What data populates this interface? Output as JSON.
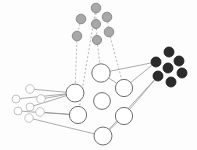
{
  "figure": {
    "background_color": "#fdfdfd",
    "width": 197,
    "height": 150
  },
  "palette": {
    "hub_fill": "#ffffff",
    "hub_stroke": "#6e6e6e",
    "leaf_light_fill": "#ffffff",
    "leaf_light_stroke": "#b4b4b4",
    "leaf_gray_fill": "#a8a8a8",
    "leaf_gray_stroke": "#7c7c7c",
    "leaf_dark_fill": "#2b2b2b",
    "leaf_dark_stroke": "#1a1a1a",
    "edge_solid": "#8a8a8a",
    "edge_dashed": "#9a9a9a"
  },
  "groups": [
    {
      "id": "hub",
      "label": "hub-nodes",
      "style": "hollow-large",
      "radius": 8.5,
      "count": 7
    },
    {
      "id": "light",
      "label": "light-leaf-cluster",
      "style": "hollow-small",
      "radius": 4.2,
      "count": 7
    },
    {
      "id": "gray",
      "label": "gray-leaf-cluster",
      "style": "filled-gray",
      "radius": 4.6,
      "count": 7
    },
    {
      "id": "dark",
      "label": "dark-leaf-cluster",
      "style": "filled-dark",
      "radius": 5.0,
      "count": 7
    }
  ],
  "nodes": [
    {
      "id": "H1",
      "group": "hub",
      "cx": 75,
      "cy": 93,
      "r": 9.0
    },
    {
      "id": "H2",
      "group": "hub",
      "cx": 78,
      "cy": 115,
      "r": 8.6
    },
    {
      "id": "H3",
      "group": "hub",
      "cx": 101,
      "cy": 73,
      "r": 9.2
    },
    {
      "id": "H4",
      "group": "hub",
      "cx": 102,
      "cy": 101,
      "r": 8.4
    },
    {
      "id": "H5",
      "group": "hub",
      "cx": 103,
      "cy": 136,
      "r": 9.0
    },
    {
      "id": "H6",
      "group": "hub",
      "cx": 124,
      "cy": 88,
      "r": 8.6
    },
    {
      "id": "H7",
      "group": "hub",
      "cx": 124,
      "cy": 116,
      "r": 8.6
    },
    {
      "id": "L1",
      "group": "light",
      "cx": 30,
      "cy": 89,
      "r": 4.3
    },
    {
      "id": "L2",
      "group": "light",
      "cx": 16,
      "cy": 99,
      "r": 4.0
    },
    {
      "id": "L3",
      "group": "light",
      "cx": 41,
      "cy": 99,
      "r": 4.3
    },
    {
      "id": "L4",
      "group": "light",
      "cx": 18,
      "cy": 111,
      "r": 4.0
    },
    {
      "id": "L5",
      "group": "light",
      "cx": 40,
      "cy": 112,
      "r": 4.3
    },
    {
      "id": "L6",
      "group": "light",
      "cx": 29,
      "cy": 118,
      "r": 4.2
    },
    {
      "id": "L7",
      "group": "light",
      "cx": 30,
      "cy": 107,
      "r": 4.0
    },
    {
      "id": "G1",
      "group": "gray",
      "cx": 96,
      "cy": 8,
      "r": 4.8
    },
    {
      "id": "G2",
      "group": "gray",
      "cx": 81,
      "cy": 19,
      "r": 4.8
    },
    {
      "id": "G3",
      "group": "gray",
      "cx": 107,
      "cy": 17,
      "r": 4.8
    },
    {
      "id": "G4",
      "group": "gray",
      "cx": 96,
      "cy": 24,
      "r": 4.6
    },
    {
      "id": "G5",
      "group": "gray",
      "cx": 109,
      "cy": 32,
      "r": 4.8
    },
    {
      "id": "G6",
      "group": "gray",
      "cx": 77,
      "cy": 36,
      "r": 4.8
    },
    {
      "id": "G7",
      "group": "gray",
      "cx": 97,
      "cy": 40,
      "r": 4.6
    },
    {
      "id": "D1",
      "group": "dark",
      "cx": 169,
      "cy": 52,
      "r": 5.0
    },
    {
      "id": "D2",
      "group": "dark",
      "cx": 156,
      "cy": 62,
      "r": 5.0
    },
    {
      "id": "D3",
      "group": "dark",
      "cx": 179,
      "cy": 61,
      "r": 5.0
    },
    {
      "id": "D4",
      "group": "dark",
      "cx": 168,
      "cy": 68,
      "r": 5.0
    },
    {
      "id": "D5",
      "group": "dark",
      "cx": 182,
      "cy": 73,
      "r": 5.0
    },
    {
      "id": "D6",
      "group": "dark",
      "cx": 158,
      "cy": 76,
      "r": 5.0
    },
    {
      "id": "D7",
      "group": "dark",
      "cx": 171,
      "cy": 82,
      "r": 5.0
    }
  ],
  "edges": [
    {
      "id": "E1",
      "from": "L1",
      "to": "H1",
      "style": "solid"
    },
    {
      "id": "E2",
      "from": "L3",
      "to": "H1",
      "style": "solid"
    },
    {
      "id": "E3",
      "from": "L2",
      "to": "H1",
      "style": "solid"
    },
    {
      "id": "E4",
      "from": "L7",
      "to": "H1",
      "style": "solid"
    },
    {
      "id": "E5",
      "from": "L5",
      "to": "H2",
      "style": "solid"
    },
    {
      "id": "E6",
      "from": "L4",
      "to": "H2",
      "style": "solid"
    },
    {
      "id": "E7",
      "from": "L6",
      "to": "H5",
      "style": "solid"
    },
    {
      "id": "E8",
      "from": "H3",
      "to": "H6",
      "style": "solid"
    },
    {
      "id": "E9",
      "from": "H6",
      "to": "D2",
      "style": "solid"
    },
    {
      "id": "E10",
      "from": "H3",
      "to": "D2",
      "style": "solid"
    },
    {
      "id": "E11",
      "from": "H7",
      "to": "D6",
      "style": "solid"
    },
    {
      "id": "E12",
      "from": "H5",
      "to": "D6",
      "style": "solid"
    },
    {
      "id": "E13",
      "from": "H5",
      "to": "H7",
      "style": "solid"
    },
    {
      "id": "E14",
      "from": "G6",
      "to": "H1",
      "style": "dashed"
    },
    {
      "id": "E15",
      "from": "G1",
      "to": "H2",
      "style": "dashed"
    },
    {
      "id": "E16",
      "from": "G7",
      "to": "H3",
      "style": "dashed"
    },
    {
      "id": "E17",
      "from": "G5",
      "to": "H6",
      "style": "dashed"
    },
    {
      "id": "E18",
      "from": "G2",
      "to": "G6",
      "style": "dashed"
    },
    {
      "id": "E19",
      "from": "G3",
      "to": "G5",
      "style": "dashed"
    },
    {
      "id": "E20",
      "from": "G1",
      "to": "G4",
      "style": "dashed"
    },
    {
      "id": "E21",
      "from": "G4",
      "to": "G7",
      "style": "dashed"
    }
  ]
}
